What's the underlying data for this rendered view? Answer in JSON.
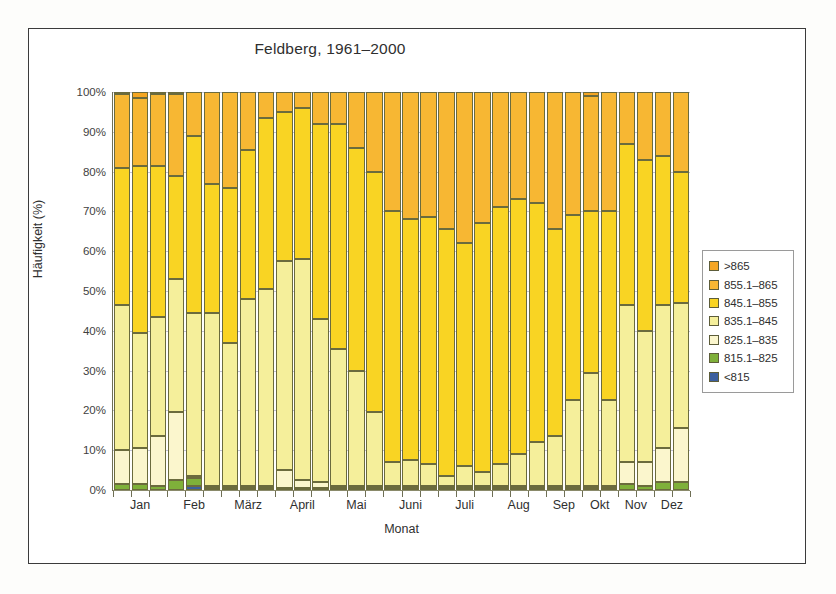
{
  "figure": {
    "title": "Feldberg, 1961–2000",
    "frame_border_color": "#3b3b3b",
    "background": "#ffffff"
  },
  "axes": {
    "ylabel": "Häufigkeit (%)",
    "xlabel": "Monat",
    "yticks": [
      "0%",
      "10%",
      "20%",
      "30%",
      "40%",
      "50%",
      "60%",
      "70%",
      "80%",
      "90%",
      "100%"
    ],
    "ytick_values": [
      0,
      10,
      20,
      30,
      40,
      50,
      60,
      70,
      80,
      90,
      100
    ],
    "ylim": [
      0,
      100
    ],
    "gridline_color": "#b9b9cf",
    "axis_color": "#6f6f55"
  },
  "legend": {
    "position": "right",
    "items": [
      {
        "label": ">865",
        "color": "#f5a623"
      },
      {
        "label": "855.1–865",
        "color": "#f7b733"
      },
      {
        "label": "845.1–855",
        "color": "#f9d423"
      },
      {
        "label": "835.1–845",
        "color": "#f5ef9b"
      },
      {
        "label": "825.1–835",
        "color": "#fbf6cd"
      },
      {
        "label": "815.1–825",
        "color": "#7fb03a"
      },
      {
        "label": "<815",
        "color": "#3c5f9e"
      }
    ]
  },
  "chart_data": {
    "type": "bar",
    "subtype": "stacked-column",
    "title": "Feldberg, 1961–2000",
    "xlabel": "Monat",
    "ylabel": "Häufigkeit (%)",
    "ylim": [
      0,
      100
    ],
    "grid": true,
    "legend_position": "right",
    "stack_order_bottom_to_top": [
      "<815",
      "815.1–825",
      "825.1–835",
      "835.1–845",
      "845.1–855",
      "855.1–865",
      ">865"
    ],
    "colors": {
      "<815": "#3c5f9e",
      "815.1–825": "#7fb03a",
      "825.1–835": "#fbf6cd",
      "835.1–845": "#f5ef9b",
      "845.1–855": "#f9d423",
      "855.1–865": "#f7b733",
      ">865": "#f5a623"
    },
    "month_groups": [
      "Jan",
      "Feb",
      "März",
      "April",
      "Mai",
      "Juni",
      "Juli",
      "Aug",
      "Sep",
      "Okt",
      "Nov",
      "Dez"
    ],
    "bars": [
      {
        "month": "Jan",
        "stack": {
          "<815": 0.0,
          "815.1–825": 1.5,
          "825.1–835": 8.5,
          "835.1–845": 36.5,
          "845.1–855": 34.5,
          "855.1–865": 18.5,
          ">865": 0.5
        }
      },
      {
        "month": "Jan",
        "stack": {
          "<815": 0.0,
          "815.1–825": 1.5,
          "825.1–835": 9.0,
          "835.1–845": 29.0,
          "845.1–855": 42.0,
          "855.1–865": 17.0,
          ">865": 1.5
        }
      },
      {
        "month": "Jan",
        "stack": {
          "<815": 0.0,
          "815.1–825": 1.0,
          "825.1–835": 12.5,
          "835.1–845": 30.0,
          "845.1–855": 38.0,
          "855.1–865": 18.0,
          ">865": 0.5
        }
      },
      {
        "month": "Feb",
        "stack": {
          "<815": 0.0,
          "815.1–825": 2.5,
          "825.1–835": 17.0,
          "835.1–845": 33.5,
          "845.1–855": 26.0,
          "855.1–865": 20.5,
          ">865": 0.5
        }
      },
      {
        "month": "Feb",
        "stack": {
          "<815": 1.0,
          "815.1–825": 2.0,
          "825.1–835": 0.5,
          "835.1–845": 41.0,
          "845.1–855": 44.5,
          "855.1–865": 11.0,
          ">865": 0.0
        }
      },
      {
        "month": "Feb",
        "stack": {
          "<815": 0.0,
          "815.1–825": 0.5,
          "825.1–835": 0.5,
          "835.1–845": 43.5,
          "845.1–855": 32.5,
          "855.1–865": 23.0,
          ">865": 0.0
        }
      },
      {
        "month": "März",
        "stack": {
          "<815": 0.0,
          "815.1–825": 0.5,
          "825.1–835": 0.5,
          "835.1–845": 36.0,
          "845.1–855": 39.0,
          "855.1–865": 24.0,
          ">865": 0.0
        }
      },
      {
        "month": "März",
        "stack": {
          "<815": 0.0,
          "815.1–825": 0.5,
          "825.1–835": 0.5,
          "835.1–845": 47.0,
          "845.1–855": 37.5,
          "855.1–865": 14.5,
          ">865": 0.0
        }
      },
      {
        "month": "März",
        "stack": {
          "<815": 0.0,
          "815.1–825": 0.5,
          "825.1–835": 0.5,
          "835.1–845": 49.5,
          "845.1–855": 43.0,
          "855.1–865": 6.5,
          ">865": 0.0
        }
      },
      {
        "month": "April",
        "stack": {
          "<815": 0.0,
          "815.1–825": 0.5,
          "825.1–835": 4.5,
          "835.1–845": 52.5,
          "845.1–855": 37.5,
          "855.1–865": 5.0,
          ">865": 0.0
        }
      },
      {
        "month": "April",
        "stack": {
          "<815": 0.0,
          "815.1–825": 0.5,
          "825.1–835": 2.0,
          "835.1–845": 55.5,
          "845.1–855": 38.0,
          "855.1–865": 4.0,
          ">865": 0.0
        }
      },
      {
        "month": "April",
        "stack": {
          "<815": 0.0,
          "815.1–825": 0.5,
          "825.1–835": 1.5,
          "835.1–845": 41.0,
          "845.1–855": 49.0,
          "855.1–865": 8.0,
          ">865": 0.0
        }
      },
      {
        "month": "Mai",
        "stack": {
          "<815": 0.0,
          "815.1–825": 0.5,
          "825.1–835": 0.5,
          "835.1–845": 34.5,
          "845.1–855": 56.5,
          "855.1–865": 8.0,
          ">865": 0.0
        }
      },
      {
        "month": "Mai",
        "stack": {
          "<815": 0.0,
          "815.1–825": 0.5,
          "825.1–835": 0.5,
          "835.1–845": 29.0,
          "845.1–855": 56.0,
          "855.1–865": 14.0,
          ">865": 0.0
        }
      },
      {
        "month": "Mai",
        "stack": {
          "<815": 0.0,
          "815.1–825": 0.5,
          "825.1–835": 0.5,
          "835.1–845": 18.5,
          "845.1–855": 60.5,
          "855.1–865": 20.0,
          ">865": 0.0
        }
      },
      {
        "month": "Juni",
        "stack": {
          "<815": 0.0,
          "815.1–825": 0.5,
          "825.1–835": 0.5,
          "835.1–845": 6.0,
          "845.1–855": 63.0,
          "855.1–865": 30.0,
          ">865": 0.0
        }
      },
      {
        "month": "Juni",
        "stack": {
          "<815": 0.0,
          "815.1–825": 0.5,
          "825.1–835": 0.5,
          "835.1–845": 6.5,
          "845.1–855": 60.5,
          "855.1–865": 32.0,
          ">865": 0.0
        }
      },
      {
        "month": "Juni",
        "stack": {
          "<815": 0.0,
          "815.1–825": 0.5,
          "825.1–835": 0.5,
          "835.1–845": 5.5,
          "845.1–855": 62.0,
          "855.1–865": 31.5,
          ">865": 0.0
        }
      },
      {
        "month": "Juli",
        "stack": {
          "<815": 0.0,
          "815.1–825": 0.5,
          "825.1–835": 0.5,
          "835.1–845": 2.5,
          "845.1–855": 62.0,
          "855.1–865": 34.5,
          ">865": 0.0
        }
      },
      {
        "month": "Juli",
        "stack": {
          "<815": 0.0,
          "815.1–825": 0.5,
          "825.1–835": 0.5,
          "835.1–845": 5.0,
          "845.1–855": 56.0,
          "855.1–865": 38.0,
          ">865": 0.0
        }
      },
      {
        "month": "Juli",
        "stack": {
          "<815": 0.0,
          "815.1–825": 0.5,
          "825.1–835": 0.5,
          "835.1–845": 3.5,
          "845.1–855": 62.5,
          "855.1–865": 33.0,
          ">865": 0.0
        }
      },
      {
        "month": "Aug",
        "stack": {
          "<815": 0.0,
          "815.1–825": 0.5,
          "825.1–835": 0.5,
          "835.1–845": 5.5,
          "845.1–855": 64.5,
          "855.1–865": 29.0,
          ">865": 0.0
        }
      },
      {
        "month": "Aug",
        "stack": {
          "<815": 0.0,
          "815.1–825": 0.5,
          "825.1–835": 0.5,
          "835.1–845": 8.0,
          "845.1–855": 64.0,
          "855.1–865": 27.0,
          ">865": 0.0
        }
      },
      {
        "month": "Aug",
        "stack": {
          "<815": 0.0,
          "815.1–825": 0.5,
          "825.1–835": 0.5,
          "835.1–845": 11.0,
          "845.1–855": 60.0,
          "855.1–865": 28.0,
          ">865": 0.0
        }
      },
      {
        "month": "Sep",
        "stack": {
          "<815": 0.0,
          "815.1–825": 0.5,
          "825.1–835": 0.5,
          "835.1–845": 12.5,
          "845.1–855": 52.0,
          "855.1–865": 34.5,
          ">865": 0.0
        }
      },
      {
        "month": "Sep",
        "stack": {
          "<815": 0.0,
          "815.1–825": 0.5,
          "825.1–835": 0.5,
          "835.1–845": 21.5,
          "845.1–855": 46.5,
          "855.1–865": 31.0,
          ">865": 0.0
        }
      },
      {
        "month": "Okt",
        "stack": {
          "<815": 0.0,
          "815.1–825": 0.5,
          "825.1–835": 0.5,
          "835.1–845": 28.5,
          "845.1–855": 40.5,
          "855.1–865": 29.0,
          ">865": 1.0
        }
      },
      {
        "month": "Okt",
        "stack": {
          "<815": 0.0,
          "815.1–825": 0.5,
          "825.1–835": 0.5,
          "835.1–845": 21.5,
          "845.1–855": 47.5,
          "855.1–865": 30.0,
          ">865": 0.0
        }
      },
      {
        "month": "Nov",
        "stack": {
          "<815": 0.0,
          "815.1–825": 1.5,
          "825.1–835": 5.5,
          "835.1–845": 39.5,
          "845.1–855": 40.5,
          "855.1–865": 13.0,
          ">865": 0.0
        }
      },
      {
        "month": "Nov",
        "stack": {
          "<815": 0.0,
          "815.1–825": 1.0,
          "825.1–835": 6.0,
          "835.1–845": 33.0,
          "845.1–855": 43.0,
          "855.1–865": 17.0,
          ">865": 0.0
        }
      },
      {
        "month": "Dez",
        "stack": {
          "<815": 0.0,
          "815.1–825": 2.0,
          "825.1–835": 8.5,
          "835.1–845": 36.0,
          "845.1–855": 37.5,
          "855.1–865": 16.0,
          ">865": 0.0
        }
      },
      {
        "month": "Dez",
        "stack": {
          "<815": 0.0,
          "815.1–825": 2.0,
          "825.1–835": 13.5,
          "835.1–845": 31.5,
          "845.1–855": 33.0,
          "855.1–865": 20.0,
          ">865": 0.0
        }
      }
    ]
  }
}
